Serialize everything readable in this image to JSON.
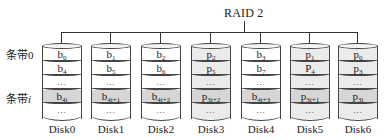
{
  "title": "RAID 2",
  "stripes": [
    {
      "prefix": "条带",
      "index": "0"
    },
    {
      "prefix": "条带",
      "index": "i"
    }
  ],
  "disks": [
    {
      "label": "Disk0",
      "type": "data",
      "rows": [
        {
          "base": "b",
          "sub": "0"
        },
        {
          "base": "b",
          "sub": "4"
        },
        {
          "base": "…",
          "sub": ""
        },
        {
          "base": "b",
          "sub": "4i"
        },
        {
          "base": "…",
          "sub": ""
        }
      ]
    },
    {
      "label": "Disk1",
      "type": "data",
      "rows": [
        {
          "base": "b",
          "sub": "1"
        },
        {
          "base": "b",
          "sub": "5"
        },
        {
          "base": "…",
          "sub": ""
        },
        {
          "base": "b",
          "sub": "4i+1"
        },
        {
          "base": "…",
          "sub": ""
        }
      ]
    },
    {
      "label": "Disk2",
      "type": "data",
      "rows": [
        {
          "base": "b",
          "sub": "2"
        },
        {
          "base": "b",
          "sub": "6"
        },
        {
          "base": "…",
          "sub": ""
        },
        {
          "base": "b",
          "sub": "4i+2"
        },
        {
          "base": "…",
          "sub": ""
        }
      ]
    },
    {
      "label": "Disk3",
      "type": "parity",
      "rows": [
        {
          "base": "p",
          "sub": "2"
        },
        {
          "base": "p",
          "sub": "5"
        },
        {
          "base": "…",
          "sub": ""
        },
        {
          "base": "p",
          "sub": "3i+2"
        },
        {
          "base": "…",
          "sub": ""
        }
      ]
    },
    {
      "label": "Disk4",
      "type": "data",
      "rows": [
        {
          "base": "b",
          "sub": "3"
        },
        {
          "base": "b",
          "sub": "7"
        },
        {
          "base": "…",
          "sub": ""
        },
        {
          "base": "b",
          "sub": "4i+3"
        },
        {
          "base": "…",
          "sub": ""
        }
      ]
    },
    {
      "label": "Disk5",
      "type": "parity",
      "rows": [
        {
          "base": "p",
          "sub": "1"
        },
        {
          "base": "P",
          "sub": "4"
        },
        {
          "base": "…",
          "sub": ""
        },
        {
          "base": "p",
          "sub": "3i+1"
        },
        {
          "base": "…",
          "sub": ""
        }
      ]
    },
    {
      "label": "Disk6",
      "type": "parity",
      "rows": [
        {
          "base": "p",
          "sub": "0"
        },
        {
          "base": "p",
          "sub": "3"
        },
        {
          "base": "…",
          "sub": ""
        },
        {
          "base": "p",
          "sub": "3i"
        },
        {
          "base": "…",
          "sub": ""
        }
      ]
    }
  ],
  "colors": {
    "line": "#333333",
    "parity_fill": "#ebebeb",
    "stripe_i_fill": "#d6d6d6"
  }
}
